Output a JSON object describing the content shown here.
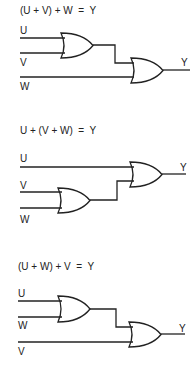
{
  "diagrams": [
    {
      "equation": "(U + V) + W  =  Y",
      "inputs": [
        "U",
        "V",
        "W"
      ],
      "output": "Y"
    },
    {
      "equation": "U + (V + W)  =  Y",
      "inputs": [
        "U",
        "V",
        "W"
      ],
      "output": "Y"
    },
    {
      "equation": "(U + W) + V  =  Y",
      "inputs": [
        "U",
        "W",
        "V"
      ],
      "output": "Y"
    }
  ],
  "colors": {
    "line": "#222222",
    "background": "#ffffff"
  }
}
